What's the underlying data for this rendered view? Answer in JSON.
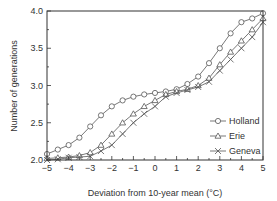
{
  "chart_data": {
    "type": "line",
    "title": "",
    "xlabel": "Deviation from 10-year mean (°C)",
    "ylabel": "Number of generations",
    "xlim": [
      -5,
      5
    ],
    "ylim": [
      2.0,
      4.0
    ],
    "xticks": [
      "−5",
      "−4",
      "−3",
      "−2",
      "−1",
      "0",
      "1",
      "2",
      "3",
      "4",
      "5"
    ],
    "yticks": [
      "2.0",
      "2.5",
      "3.0",
      "3.5",
      "4.0"
    ],
    "grid": false,
    "legend_position": "lower right",
    "x": [
      -5,
      -4.5,
      -4,
      -3.5,
      -3,
      -2.5,
      -2,
      -1.5,
      -1,
      -0.5,
      0,
      0.5,
      1,
      1.5,
      2,
      2.5,
      3,
      3.5,
      4,
      4.5,
      5
    ],
    "series": [
      {
        "name": "Holland",
        "marker": "circle",
        "values": [
          2.08,
          2.14,
          2.2,
          2.3,
          2.45,
          2.6,
          2.72,
          2.8,
          2.85,
          2.88,
          2.9,
          2.92,
          2.95,
          3.02,
          3.12,
          3.3,
          3.5,
          3.7,
          3.85,
          3.9,
          3.97
        ]
      },
      {
        "name": "Erie",
        "marker": "triangle",
        "values": [
          2.02,
          2.03,
          2.04,
          2.06,
          2.1,
          2.2,
          2.35,
          2.5,
          2.62,
          2.72,
          2.8,
          2.88,
          2.92,
          2.95,
          3.0,
          3.1,
          3.28,
          3.45,
          3.6,
          3.75,
          3.9
        ]
      },
      {
        "name": "Geneva",
        "marker": "x",
        "values": [
          2.0,
          2.01,
          2.03,
          2.04,
          2.05,
          2.12,
          2.2,
          2.35,
          2.5,
          2.62,
          2.72,
          2.85,
          2.9,
          2.94,
          2.98,
          3.05,
          3.2,
          3.35,
          3.5,
          3.65,
          3.85
        ]
      }
    ]
  }
}
